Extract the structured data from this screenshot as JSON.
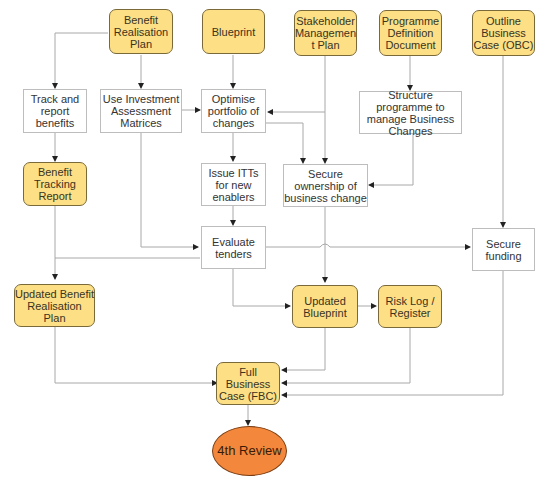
{
  "diagram": {
    "nodes": {
      "benefit_realisation_plan": "Benefit Realisation Plan",
      "blueprint": "Blueprint",
      "stakeholder_management_plan": "Stakeholder Managemen t Plan",
      "programme_definition_document": "Programme Definition Document",
      "outline_business_case": "Outline Business Case (OBC)",
      "track_report_benefits": "Track and report benefits",
      "use_investment_matrices": "Use Investment Assessment Matrices",
      "optimise_portfolio": "Optimise portfolio of changes",
      "structure_programme": "Structure programme to manage Business Changes",
      "benefit_tracking_report": "Benefit Tracking Report",
      "issue_itts": "Issue ITTs for new enablers",
      "secure_ownership": "Secure ownership of business change",
      "evaluate_tenders": "Evaluate tenders",
      "secure_funding": "Secure funding",
      "updated_benefit_realisation_plan": "Updated Benefit Realisation Plan",
      "updated_blueprint": "Updated Blueprint",
      "risk_log_register": "Risk Log / Register",
      "full_business_case": "Full Business Case (FBC)",
      "fourth_review": "4th Review"
    },
    "colors": {
      "document_fill": "#fddf86",
      "document_border": "#7a6a3a",
      "process_fill": "#ffffff",
      "process_border": "#bdbdbd",
      "milestone_fill": "#f3883c",
      "connector": "#a8a8a8",
      "arrowhead": "#222222"
    },
    "edges": [
      [
        "Benefit Realisation Plan",
        "Track and report benefits"
      ],
      [
        "Benefit Realisation Plan",
        "Use Investment Assessment Matrices"
      ],
      [
        "Blueprint",
        "Optimise portfolio of changes"
      ],
      [
        "Stakeholder Management Plan",
        "Optimise portfolio of changes"
      ],
      [
        "Stakeholder Management Plan",
        "Secure ownership of business change"
      ],
      [
        "Programme Definition Document",
        "Structure programme to manage Business Changes"
      ],
      [
        "Structure programme to manage Business Changes",
        "Secure ownership of business change"
      ],
      [
        "Outline Business Case (OBC)",
        "Secure funding"
      ],
      [
        "Use Investment Assessment Matrices",
        "Optimise portfolio of changes"
      ],
      [
        "Use Investment Assessment Matrices",
        "Evaluate tenders"
      ],
      [
        "Optimise portfolio of changes",
        "Issue ITTs for new enablers"
      ],
      [
        "Optimise portfolio of changes",
        "Secure ownership of business change"
      ],
      [
        "Track and report benefits",
        "Benefit Tracking Report"
      ],
      [
        "Issue ITTs for new enablers",
        "Evaluate tenders"
      ],
      [
        "Evaluate tenders",
        "Secure funding"
      ],
      [
        "Evaluate tenders",
        "Updated Benefit Realisation Plan"
      ],
      [
        "Evaluate tenders",
        "Updated Blueprint"
      ],
      [
        "Benefit Tracking Report",
        "Updated Benefit Realisation Plan"
      ],
      [
        "Secure ownership of business change",
        "Updated Blueprint"
      ],
      [
        "Updated Blueprint",
        "Risk Log / Register"
      ],
      [
        "Updated Benefit Realisation Plan",
        "Full Business Case (FBC)"
      ],
      [
        "Updated Blueprint",
        "Full Business Case (FBC)"
      ],
      [
        "Risk Log / Register",
        "Full Business Case (FBC)"
      ],
      [
        "Secure funding",
        "Full Business Case (FBC)"
      ],
      [
        "Full Business Case (FBC)",
        "4th Review"
      ]
    ]
  }
}
